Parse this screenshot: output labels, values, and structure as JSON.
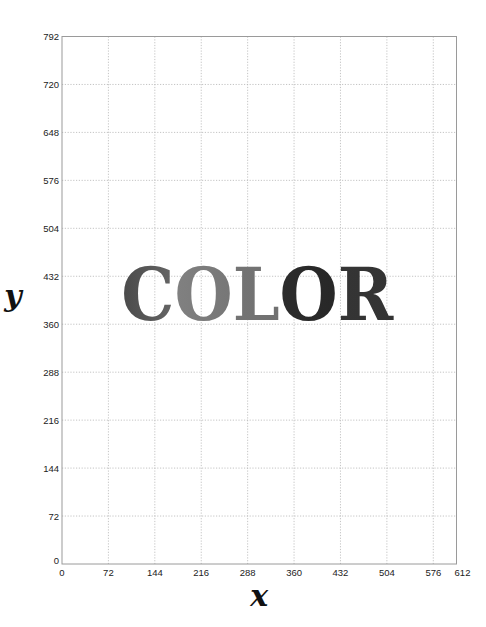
{
  "chart_data": {
    "type": "other",
    "title": "",
    "xlabel": "x",
    "ylabel": "y",
    "xlim": [
      0,
      612
    ],
    "ylim": [
      0,
      792
    ],
    "x_ticks": [
      0,
      72,
      144,
      216,
      288,
      360,
      432,
      504,
      576,
      612
    ],
    "y_ticks": [
      0,
      72,
      144,
      216,
      288,
      360,
      432,
      504,
      576,
      648,
      720,
      792
    ],
    "grid": true,
    "grid_style": "dotted",
    "annotations": [
      {
        "text": "COLOR",
        "x_range": [
          92,
          514
        ],
        "y_baseline": 366,
        "style": "bold serif, per-letter grayscale gradients",
        "letters": [
          {
            "char": "C",
            "gradient": [
              "#4a4a4a",
              "#d8d8d8"
            ]
          },
          {
            "char": "O",
            "gradient": [
              "#8a8a8a",
              "#5a5a5a"
            ]
          },
          {
            "char": "L",
            "gradient": [
              "#7a7a7a",
              "#6a6a6a"
            ]
          },
          {
            "char": "O",
            "gradient": [
              "#3a3a3a",
              "#222222"
            ]
          },
          {
            "char": "R",
            "gradient": [
              "#3c3c3c",
              "#333333"
            ]
          }
        ]
      }
    ]
  },
  "labels": {
    "x_axis": "x",
    "y_axis": "y",
    "word": "COLOR"
  },
  "colors": {
    "frame": "#9a9a9a",
    "grid": "#b5b5b5",
    "tick_text": "#222222"
  }
}
